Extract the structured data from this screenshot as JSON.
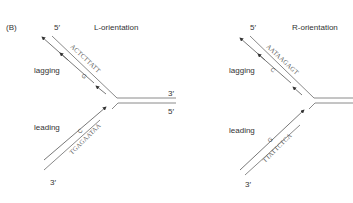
{
  "panel_label": "(B)",
  "diagrams": [
    {
      "title": "L-orientation",
      "lagging_label": "lagging",
      "leading_label": "leading",
      "top_end_label": "5′",
      "bottom_end_label": "3′",
      "right_top_label": "3′",
      "right_bottom_label": "5′",
      "lagging_sequence": "ACTCTTATT",
      "lagging_base": "G",
      "leading_sequence": "TGAGAATAA",
      "leading_base": "C"
    },
    {
      "title": "R-orientation",
      "lagging_label": "lagging",
      "leading_label": "leading",
      "top_end_label": "5′",
      "bottom_end_label": "3′",
      "lagging_sequence": "AATAAGAGT",
      "lagging_base": "C",
      "leading_sequence": "TTATTCTCA",
      "leading_base": "G"
    }
  ],
  "colors": {
    "template_strand": "#8a8a8a",
    "new_strand": "#555555",
    "text": "#333333"
  }
}
